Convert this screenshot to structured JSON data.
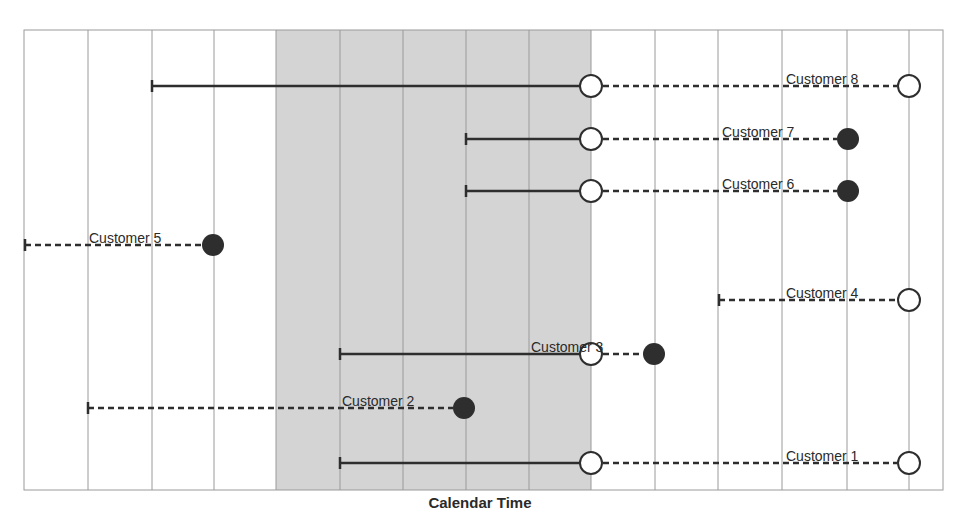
{
  "diagram": {
    "x_axis_label": "Calendar Time",
    "colors": {
      "background": "#ffffff",
      "observation_window": "#d4d4d4",
      "grid": "#9a9a9a",
      "line": "#2e2e2e",
      "event_marker": "#2e2e2e",
      "censored_marker_fill": "#ffffff"
    },
    "legend_semantics": {
      "filled_circle": "event",
      "open_circle": "censored / no event",
      "solid_line": "observed during window",
      "dashed_line": "outside observation window"
    },
    "observation_window": {
      "start_col": 4,
      "end_col": 9
    },
    "grid_columns": 14,
    "customers": [
      {
        "label": "Customer 8",
        "start": 2.0,
        "end": 14.0,
        "end_marker": "open"
      },
      {
        "label": "Customer 7",
        "start": 7.0,
        "end": 13.0,
        "end_marker": "filled"
      },
      {
        "label": "Customer 6",
        "start": 7.0,
        "end": 13.0,
        "end_marker": "filled"
      },
      {
        "label": "Customer 5",
        "start": 0.0,
        "end": 3.0,
        "end_marker": "filled"
      },
      {
        "label": "Customer 4",
        "start": 11.0,
        "end": 14.0,
        "end_marker": "open"
      },
      {
        "label": "Customer 3",
        "start": 5.0,
        "end": 10.0,
        "end_marker": "filled"
      },
      {
        "label": "Customer 2",
        "start": 1.0,
        "end": 7.0,
        "end_marker": "filled"
      },
      {
        "label": "Customer 1",
        "start": 5.0,
        "end": 14.0,
        "end_marker": "open"
      }
    ]
  }
}
